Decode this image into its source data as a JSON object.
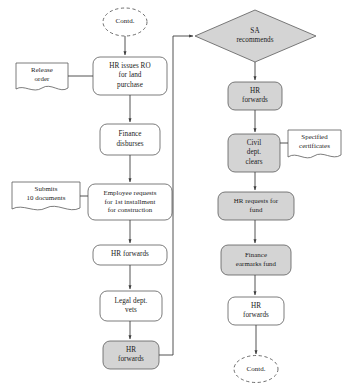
{
  "diagram": {
    "style": {
      "shaded_fill": "#d4d4d4",
      "plain_fill": "#ffffff",
      "stroke": "#3f3f3f",
      "background": "#ffffff"
    },
    "terminators": [
      {
        "id": "contd-top",
        "label": "Contd.",
        "shape": "dashed-ellipse"
      },
      {
        "id": "contd-bottom",
        "label": "Contd.",
        "shape": "dashed-ellipse"
      }
    ],
    "decisions": [
      {
        "id": "sa-recommends",
        "label": "SA\nrecommends",
        "shape": "diamond",
        "fill": "shaded"
      }
    ],
    "documents": [
      {
        "id": "release-order",
        "label": "Release\norder",
        "shape": "document"
      },
      {
        "id": "submits-10-documents",
        "label": "Submits\n10 documents",
        "shape": "document"
      },
      {
        "id": "specified-certificates",
        "label": "Specified\ncertificates",
        "shape": "document"
      }
    ],
    "left_column": [
      {
        "id": "hr-issues-ro",
        "label": "HR issues RO\nfor land\npurchase",
        "fill": "plain"
      },
      {
        "id": "finance-disburses",
        "label": "Finance\ndisburses",
        "fill": "plain"
      },
      {
        "id": "employee-requests-installment",
        "label": "Employee requests\nfor 1st installment\nfor construction",
        "fill": "plain"
      },
      {
        "id": "hr-forwards-left",
        "label": "HR forwards",
        "fill": "plain"
      },
      {
        "id": "legal-dept-vets",
        "label": "Legal dept.\nvets",
        "fill": "plain"
      },
      {
        "id": "hr-forwards-shaded",
        "label": "HR\nforwards",
        "fill": "shaded"
      }
    ],
    "right_column": [
      {
        "id": "hr-forwards-right",
        "label": "HR\nforwards",
        "fill": "shaded"
      },
      {
        "id": "civil-dept-clears",
        "label": "Civil\ndept.\nclears",
        "fill": "shaded"
      },
      {
        "id": "hr-requests-fund",
        "label": "HR requests for\nfund",
        "fill": "shaded"
      },
      {
        "id": "finance-earmarks-fund",
        "label": "Finance\nearmarks fund",
        "fill": "shaded"
      },
      {
        "id": "hr-forwards-bottom",
        "label": "HR\nforwards",
        "fill": "plain"
      }
    ],
    "connectors": [
      {
        "from": "contd-top",
        "to": "hr-issues-ro",
        "arrow": true
      },
      {
        "from": "release-order",
        "to": "hr-issues-ro",
        "arrow": false
      },
      {
        "from": "hr-issues-ro",
        "to": "finance-disburses",
        "arrow": true
      },
      {
        "from": "finance-disburses",
        "to": "employee-requests-installment",
        "arrow": true
      },
      {
        "from": "submits-10-documents",
        "to": "employee-requests-installment",
        "arrow": false
      },
      {
        "from": "employee-requests-installment",
        "to": "hr-forwards-left",
        "arrow": true
      },
      {
        "from": "hr-forwards-left",
        "to": "legal-dept-vets",
        "arrow": true
      },
      {
        "from": "legal-dept-vets",
        "to": "hr-forwards-shaded",
        "arrow": true
      },
      {
        "from": "hr-forwards-shaded",
        "to": "sa-recommends",
        "arrow": true
      },
      {
        "from": "sa-recommends",
        "to": "hr-forwards-right",
        "arrow": true
      },
      {
        "from": "hr-forwards-right",
        "to": "civil-dept-clears",
        "arrow": true
      },
      {
        "from": "specified-certificates",
        "to": "civil-dept-clears",
        "arrow": false
      },
      {
        "from": "civil-dept-clears",
        "to": "hr-requests-fund",
        "arrow": true
      },
      {
        "from": "hr-requests-fund",
        "to": "finance-earmarks-fund",
        "arrow": true
      },
      {
        "from": "finance-earmarks-fund",
        "to": "hr-forwards-bottom",
        "arrow": true
      },
      {
        "from": "hr-forwards-bottom",
        "to": "contd-bottom",
        "arrow": true
      }
    ]
  }
}
